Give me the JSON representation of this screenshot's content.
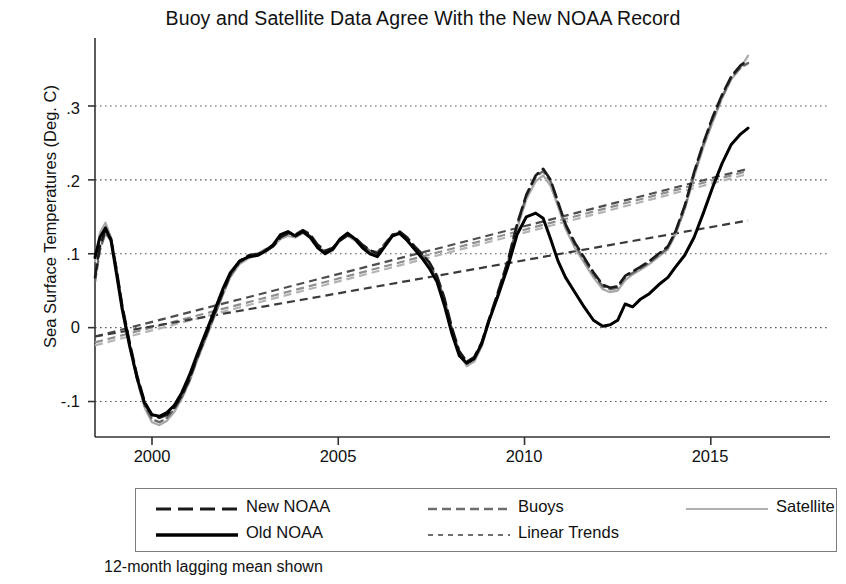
{
  "chart_data": {
    "type": "line",
    "title": "Buoy and Satellite Data Agree With the New NOAA Record",
    "xlabel": "",
    "ylabel": "Sea Surface Temperatures (Deg. C)",
    "caption": "12-month lagging mean shown",
    "xlim": [
      1998.47,
      2018.2
    ],
    "ylim": [
      -0.148,
      0.392
    ],
    "xticks": [
      2000,
      2005,
      2010,
      2015
    ],
    "xtick_labels": [
      "2000",
      "2005",
      "2010",
      "2015"
    ],
    "yticks": [
      -0.1,
      0,
      0.1,
      0.2,
      0.3
    ],
    "ytick_labels": [
      "-.1",
      "0",
      ".1",
      ".2",
      ".3"
    ],
    "grid": "horizontal-dotted",
    "legend_position": "below-plot",
    "series": [
      {
        "name": "New NOAA",
        "style": "long-dash",
        "color": "#1a1a1a",
        "width": 2.6,
        "x": [
          1998.47,
          1998.6,
          1998.75,
          1998.9,
          1999.05,
          1999.2,
          1999.4,
          1999.6,
          1999.8,
          2000.0,
          2000.2,
          2000.4,
          2000.6,
          2000.8,
          2001.0,
          2001.2,
          2001.45,
          2001.7,
          2001.9,
          2002.1,
          2002.35,
          2002.6,
          2002.85,
          2003.05,
          2003.25,
          2003.45,
          2003.65,
          2003.85,
          2004.05,
          2004.25,
          2004.45,
          2004.65,
          2004.85,
          2005.05,
          2005.25,
          2005.45,
          2005.65,
          2005.85,
          2006.05,
          2006.25,
          2006.45,
          2006.65,
          2006.85,
          2007.05,
          2007.25,
          2007.45,
          2007.65,
          2007.85,
          2008.05,
          2008.25,
          2008.45,
          2008.65,
          2008.85,
          2009.05,
          2009.3,
          2009.55,
          2009.8,
          2010.05,
          2010.3,
          2010.5,
          2010.7,
          2010.9,
          2011.1,
          2011.35,
          2011.6,
          2011.85,
          2012.1,
          2012.3,
          2012.5,
          2012.7,
          2012.9,
          2013.1,
          2013.35,
          2013.6,
          2013.85,
          2014.05,
          2014.3,
          2014.55,
          2014.8,
          2015.05,
          2015.3,
          2015.55,
          2015.8,
          2016.0
        ],
        "y": [
          0.068,
          0.11,
          0.132,
          0.12,
          0.078,
          0.03,
          -0.02,
          -0.065,
          -0.1,
          -0.118,
          -0.122,
          -0.118,
          -0.108,
          -0.092,
          -0.07,
          -0.042,
          -0.01,
          0.022,
          0.048,
          0.072,
          0.09,
          0.098,
          0.1,
          0.104,
          0.11,
          0.122,
          0.128,
          0.126,
          0.132,
          0.126,
          0.112,
          0.104,
          0.108,
          0.118,
          0.125,
          0.122,
          0.112,
          0.105,
          0.1,
          0.112,
          0.125,
          0.13,
          0.122,
          0.11,
          0.1,
          0.088,
          0.07,
          0.04,
          0.0,
          -0.032,
          -0.046,
          -0.04,
          -0.02,
          0.012,
          0.05,
          0.09,
          0.14,
          0.18,
          0.206,
          0.215,
          0.2,
          0.17,
          0.14,
          0.115,
          0.095,
          0.075,
          0.058,
          0.054,
          0.056,
          0.07,
          0.076,
          0.082,
          0.09,
          0.1,
          0.11,
          0.13,
          0.165,
          0.21,
          0.25,
          0.285,
          0.315,
          0.34,
          0.355,
          0.362
        ]
      },
      {
        "name": "Old NOAA",
        "style": "solid",
        "color": "#000000",
        "width": 3.0,
        "x": [
          1998.47,
          1998.6,
          1998.75,
          1998.9,
          1999.05,
          1999.2,
          1999.4,
          1999.6,
          1999.8,
          2000.0,
          2000.2,
          2000.4,
          2000.6,
          2000.8,
          2001.0,
          2001.2,
          2001.45,
          2001.7,
          2001.9,
          2002.1,
          2002.35,
          2002.6,
          2002.85,
          2003.05,
          2003.25,
          2003.45,
          2003.65,
          2003.85,
          2004.05,
          2004.25,
          2004.45,
          2004.65,
          2004.85,
          2005.05,
          2005.25,
          2005.45,
          2005.65,
          2005.85,
          2006.05,
          2006.25,
          2006.45,
          2006.65,
          2006.85,
          2007.05,
          2007.25,
          2007.45,
          2007.65,
          2007.85,
          2008.05,
          2008.25,
          2008.45,
          2008.65,
          2008.85,
          2009.05,
          2009.3,
          2009.55,
          2009.8,
          2010.05,
          2010.3,
          2010.5,
          2010.7,
          2010.9,
          2011.1,
          2011.35,
          2011.6,
          2011.85,
          2012.1,
          2012.3,
          2012.5,
          2012.7,
          2012.9,
          2013.1,
          2013.35,
          2013.6,
          2013.85,
          2014.05,
          2014.3,
          2014.55,
          2014.8,
          2015.05,
          2015.3,
          2015.55,
          2015.8,
          2016.0
        ],
        "y": [
          0.095,
          0.122,
          0.135,
          0.118,
          0.072,
          0.025,
          -0.025,
          -0.068,
          -0.102,
          -0.118,
          -0.12,
          -0.115,
          -0.105,
          -0.088,
          -0.065,
          -0.038,
          -0.006,
          0.026,
          0.052,
          0.074,
          0.09,
          0.096,
          0.098,
          0.104,
          0.112,
          0.126,
          0.13,
          0.124,
          0.13,
          0.122,
          0.108,
          0.1,
          0.106,
          0.12,
          0.128,
          0.12,
          0.108,
          0.1,
          0.096,
          0.11,
          0.124,
          0.128,
          0.118,
          0.106,
          0.094,
          0.08,
          0.062,
          0.03,
          -0.008,
          -0.038,
          -0.048,
          -0.042,
          -0.022,
          0.01,
          0.045,
          0.082,
          0.126,
          0.15,
          0.155,
          0.148,
          0.12,
          0.09,
          0.068,
          0.048,
          0.028,
          0.01,
          0.002,
          0.004,
          0.01,
          0.032,
          0.028,
          0.038,
          0.046,
          0.058,
          0.068,
          0.082,
          0.098,
          0.122,
          0.155,
          0.19,
          0.222,
          0.248,
          0.262,
          0.27
        ]
      },
      {
        "name": "Buoys",
        "style": "medium-dash",
        "color": "#676767",
        "width": 2.4,
        "x": [
          1998.47,
          1998.6,
          1998.75,
          1998.9,
          1999.05,
          1999.2,
          1999.4,
          1999.6,
          1999.8,
          2000.0,
          2000.2,
          2000.4,
          2000.6,
          2000.8,
          2001.0,
          2001.2,
          2001.45,
          2001.7,
          2001.9,
          2002.1,
          2002.35,
          2002.6,
          2002.85,
          2003.05,
          2003.25,
          2003.45,
          2003.65,
          2003.85,
          2004.05,
          2004.25,
          2004.45,
          2004.65,
          2004.85,
          2005.05,
          2005.25,
          2005.45,
          2005.65,
          2005.85,
          2006.05,
          2006.25,
          2006.45,
          2006.65,
          2006.85,
          2007.05,
          2007.25,
          2007.45,
          2007.65,
          2007.85,
          2008.05,
          2008.25,
          2008.45,
          2008.65,
          2008.85,
          2009.05,
          2009.3,
          2009.55,
          2009.8,
          2010.05,
          2010.3,
          2010.5,
          2010.7,
          2010.9,
          2011.1,
          2011.35,
          2011.6,
          2011.85,
          2012.1,
          2012.3,
          2012.5,
          2012.7,
          2012.9,
          2013.1,
          2013.35,
          2013.6,
          2013.85,
          2014.05,
          2014.3,
          2014.55,
          2014.8,
          2015.05,
          2015.3,
          2015.55,
          2015.8,
          2016.0
        ],
        "y": [
          0.062,
          0.105,
          0.128,
          0.118,
          0.076,
          0.028,
          -0.024,
          -0.07,
          -0.105,
          -0.124,
          -0.128,
          -0.122,
          -0.11,
          -0.094,
          -0.072,
          -0.044,
          -0.012,
          0.02,
          0.046,
          0.07,
          0.088,
          0.096,
          0.1,
          0.106,
          0.112,
          0.124,
          0.126,
          0.124,
          0.13,
          0.124,
          0.11,
          0.102,
          0.106,
          0.12,
          0.126,
          0.12,
          0.11,
          0.104,
          0.102,
          0.114,
          0.126,
          0.128,
          0.12,
          0.108,
          0.098,
          0.086,
          0.068,
          0.038,
          -0.002,
          -0.034,
          -0.048,
          -0.042,
          -0.022,
          0.01,
          0.048,
          0.088,
          0.138,
          0.178,
          0.204,
          0.212,
          0.198,
          0.168,
          0.138,
          0.112,
          0.092,
          0.072,
          0.056,
          0.052,
          0.054,
          0.068,
          0.074,
          0.08,
          0.088,
          0.098,
          0.108,
          0.128,
          0.162,
          0.208,
          0.248,
          0.282,
          0.312,
          0.338,
          0.352,
          0.358
        ]
      },
      {
        "name": "Satellite",
        "style": "solid",
        "color": "#a8a8a8",
        "width": 2.2,
        "x": [
          1998.47,
          1998.6,
          1998.75,
          1998.9,
          1999.05,
          1999.2,
          1999.4,
          1999.6,
          1999.8,
          2000.0,
          2000.2,
          2000.4,
          2000.6,
          2000.8,
          2001.0,
          2001.2,
          2001.45,
          2001.7,
          2001.9,
          2002.1,
          2002.35,
          2002.6,
          2002.85,
          2003.05,
          2003.25,
          2003.45,
          2003.65,
          2003.85,
          2004.05,
          2004.25,
          2004.45,
          2004.65,
          2004.85,
          2005.05,
          2005.25,
          2005.45,
          2005.65,
          2005.85,
          2006.05,
          2006.25,
          2006.45,
          2006.65,
          2006.85,
          2007.05,
          2007.25,
          2007.45,
          2007.65,
          2007.85,
          2008.05,
          2008.25,
          2008.45,
          2008.65,
          2008.85,
          2009.05,
          2009.3,
          2009.55,
          2009.8,
          2010.05,
          2010.3,
          2010.5,
          2010.7,
          2010.9,
          2011.1,
          2011.35,
          2011.6,
          2011.85,
          2012.1,
          2012.3,
          2012.5,
          2012.7,
          2012.9,
          2013.1,
          2013.35,
          2013.6,
          2013.85,
          2014.05,
          2014.3,
          2014.55,
          2014.8,
          2015.05,
          2015.3,
          2015.55,
          2015.8,
          2016.0
        ],
        "y": [
          0.09,
          0.128,
          0.142,
          0.122,
          0.08,
          0.03,
          -0.022,
          -0.07,
          -0.108,
          -0.128,
          -0.132,
          -0.126,
          -0.114,
          -0.096,
          -0.074,
          -0.046,
          -0.014,
          0.018,
          0.044,
          0.068,
          0.086,
          0.094,
          0.098,
          0.102,
          0.11,
          0.12,
          0.124,
          0.122,
          0.128,
          0.122,
          0.108,
          0.1,
          0.104,
          0.118,
          0.124,
          0.118,
          0.108,
          0.102,
          0.1,
          0.112,
          0.124,
          0.126,
          0.118,
          0.106,
          0.096,
          0.084,
          0.066,
          0.036,
          -0.004,
          -0.036,
          -0.052,
          -0.046,
          -0.026,
          0.008,
          0.046,
          0.086,
          0.134,
          0.174,
          0.198,
          0.206,
          0.192,
          0.164,
          0.134,
          0.108,
          0.088,
          0.068,
          0.052,
          0.048,
          0.05,
          0.064,
          0.072,
          0.078,
          0.086,
          0.096,
          0.106,
          0.126,
          0.16,
          0.204,
          0.244,
          0.278,
          0.31,
          0.336,
          0.352,
          0.368
        ]
      }
    ],
    "trend_lines": [
      {
        "name": "Trend New NOAA",
        "style": "dashed",
        "color": "#4d4d4d",
        "x": [
          1998.47,
          2016.0
        ],
        "y": [
          -0.012,
          0.215
        ]
      },
      {
        "name": "Trend Buoys",
        "style": "dashed",
        "color": "#8f8f8f",
        "x": [
          1998.47,
          2016.0
        ],
        "y": [
          -0.02,
          0.212
        ]
      },
      {
        "name": "Trend Satellite",
        "style": "dashed",
        "color": "#b4b4b4",
        "x": [
          1998.47,
          2016.0
        ],
        "y": [
          -0.024,
          0.208
        ]
      },
      {
        "name": "Trend Old NOAA",
        "style": "dashed",
        "color": "#3a3a3a",
        "x": [
          1998.47,
          2016.0
        ],
        "y": [
          -0.012,
          0.145
        ]
      }
    ],
    "legend": [
      {
        "label": "New NOAA",
        "style": "long-dash",
        "color": "#1a1a1a",
        "width": 3.2
      },
      {
        "label": "Buoys",
        "style": "medium-dash",
        "color": "#6e6e6e",
        "width": 2.6
      },
      {
        "label": "Satellite",
        "style": "solid",
        "color": "#b0b0b0",
        "width": 1.8
      },
      {
        "label": "Old NOAA",
        "style": "solid",
        "color": "#000000",
        "width": 3.6
      },
      {
        "label": "Linear Trends",
        "style": "short-dash",
        "color": "#6e6e6e",
        "width": 2.2
      }
    ]
  }
}
